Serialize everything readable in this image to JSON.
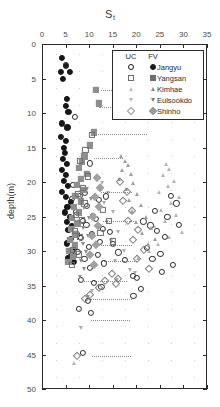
{
  "chart_data": {
    "type": "scatter",
    "title": "S",
    "title_subscript": "t",
    "xlabel": "",
    "ylabel": "depth(m)",
    "xlim": [
      0,
      35
    ],
    "ylim": [
      0,
      50
    ],
    "y_inverted": true,
    "xticks": [
      0,
      5,
      10,
      15,
      20,
      25,
      30,
      35
    ],
    "yticks": [
      0,
      5,
      10,
      15,
      20,
      25,
      30,
      35,
      40,
      45,
      50
    ],
    "grid": false,
    "legend": {
      "position": "top-right-inside",
      "columns": [
        "UC",
        "FV"
      ],
      "entries": [
        {
          "label": "Jangyu",
          "shape": "circle",
          "uc_fill": "open",
          "fv_fill": "filled",
          "color": "#1a1a1a"
        },
        {
          "label": "Yangsan",
          "shape": "square",
          "uc_fill": "open",
          "fv_fill": "filled",
          "color": "#6e6e6e"
        },
        {
          "label": "Kimhae",
          "shape": "triangle-up",
          "uc_fill": "open",
          "fv_fill": "filled",
          "color": "#8a8a8a"
        },
        {
          "label": "Eulsookdo",
          "shape": "triangle-down",
          "uc_fill": "open",
          "fv_fill": "filled",
          "color": "#7d7d7d"
        },
        {
          "label": "Shinho",
          "shape": "diamond",
          "uc_fill": "open",
          "fv_fill": "filled",
          "color": "#9a9a9a"
        }
      ]
    },
    "series": [
      {
        "name": "Jangyu FV",
        "shape": "circle",
        "fill": "filled",
        "color": "#161616",
        "points": [
          [
            4.3,
            2.0
          ],
          [
            5.0,
            3.2
          ],
          [
            4.0,
            4.0
          ],
          [
            5.9,
            4.0
          ],
          [
            4.5,
            5.0
          ],
          [
            5.3,
            7.9
          ],
          [
            5.0,
            9.0
          ],
          [
            5.6,
            9.8
          ],
          [
            4.2,
            11.5
          ],
          [
            5.4,
            12.1
          ],
          [
            4.0,
            13.5
          ],
          [
            5.0,
            14.1
          ],
          [
            4.6,
            15.0
          ],
          [
            4.8,
            15.8
          ],
          [
            4.4,
            16.6
          ],
          [
            5.2,
            17.4
          ],
          [
            4.2,
            18.2
          ],
          [
            5.0,
            19.0
          ],
          [
            4.6,
            19.8
          ],
          [
            5.5,
            20.6
          ],
          [
            4.2,
            21.4
          ],
          [
            5.0,
            22.2
          ],
          [
            6.2,
            22.9
          ],
          [
            5.4,
            23.6
          ],
          [
            4.8,
            24.4
          ],
          [
            6.0,
            25.1
          ],
          [
            5.2,
            25.8
          ],
          [
            6.4,
            26.4
          ],
          [
            5.6,
            27.0
          ],
          [
            7.3,
            27.6
          ],
          [
            6.1,
            28.2
          ],
          [
            5.2,
            28.9
          ],
          [
            7.0,
            29.6
          ],
          [
            6.2,
            30.3
          ],
          [
            5.6,
            31.0
          ],
          [
            6.8,
            31.6
          ]
        ]
      },
      {
        "name": "Jangyu UC",
        "shape": "circle",
        "fill": "open",
        "color": "#2b2b2b",
        "points": [
          [
            5.0,
            3.0
          ],
          [
            6.9,
            10.6
          ],
          [
            6.6,
            20.4
          ],
          [
            9.1,
            21.6
          ],
          [
            6.3,
            22.4
          ],
          [
            10.2,
            17.3
          ],
          [
            8.0,
            22.0
          ],
          [
            9.6,
            23.5
          ],
          [
            7.2,
            24.3
          ],
          [
            10.8,
            24.9
          ],
          [
            8.6,
            25.6
          ],
          [
            12.1,
            22.6
          ],
          [
            13.6,
            22.1
          ],
          [
            11.5,
            25.3
          ],
          [
            9.4,
            26.2
          ],
          [
            13.0,
            26.8
          ],
          [
            10.5,
            27.5
          ],
          [
            8.3,
            28.1
          ],
          [
            14.4,
            27.2
          ],
          [
            12.3,
            28.7
          ],
          [
            9.9,
            29.4
          ],
          [
            7.5,
            30.1
          ],
          [
            15.1,
            29.0
          ],
          [
            11.8,
            30.6
          ],
          [
            9.0,
            31.2
          ],
          [
            16.2,
            30.2
          ],
          [
            13.2,
            31.8
          ],
          [
            10.1,
            32.4
          ],
          [
            17.6,
            31.3
          ],
          [
            19.2,
            33.6
          ],
          [
            20.1,
            33.9
          ],
          [
            8.2,
            34.2
          ],
          [
            11.0,
            34.6
          ],
          [
            21.5,
            25.7
          ],
          [
            23.0,
            26.3
          ],
          [
            24.4,
            27.1
          ],
          [
            26.0,
            28.0
          ],
          [
            22.3,
            29.5
          ],
          [
            25.1,
            30.4
          ],
          [
            27.3,
            22.0
          ],
          [
            28.5,
            23.1
          ],
          [
            24.0,
            24.2
          ],
          [
            26.6,
            25.0
          ],
          [
            29.0,
            26.2
          ],
          [
            23.4,
            31.1
          ],
          [
            27.8,
            32.0
          ],
          [
            25.4,
            33.0
          ],
          [
            21.0,
            35.5
          ],
          [
            19.4,
            36.5
          ],
          [
            9.8,
            37.2
          ],
          [
            12.6,
            35.2
          ],
          [
            7.9,
            38.4
          ],
          [
            10.4,
            39.0
          ],
          [
            8.6,
            44.8
          ]
        ]
      },
      {
        "name": "Yangsan FV",
        "shape": "square",
        "fill": "filled",
        "color": "#8e8e8e",
        "points": [
          [
            11.4,
            6.6
          ],
          [
            12.0,
            8.6
          ],
          [
            11.0,
            12.8
          ],
          [
            10.2,
            14.7
          ],
          [
            9.0,
            16.3
          ],
          [
            8.4,
            17.1
          ],
          [
            7.8,
            18.0
          ],
          [
            9.6,
            18.8
          ],
          [
            8.2,
            19.6
          ],
          [
            7.4,
            20.4
          ],
          [
            8.9,
            21.2
          ],
          [
            7.1,
            22.0
          ],
          [
            8.3,
            22.8
          ],
          [
            6.8,
            23.6
          ],
          [
            7.9,
            24.4
          ],
          [
            6.4,
            25.2
          ],
          [
            7.5,
            26.0
          ],
          [
            6.2,
            26.8
          ],
          [
            7.1,
            27.6
          ],
          [
            6.0,
            28.4
          ],
          [
            6.9,
            29.2
          ],
          [
            5.8,
            30.0
          ],
          [
            6.6,
            30.8
          ],
          [
            5.6,
            31.6
          ]
        ]
      },
      {
        "name": "Yangsan UC",
        "shape": "square",
        "fill": "open",
        "color": "#6e6e6e",
        "points": [
          [
            10.6,
            13.2
          ],
          [
            9.2,
            15.4
          ],
          [
            8.0,
            16.9
          ],
          [
            9.8,
            19.2
          ],
          [
            8.6,
            20.9
          ],
          [
            7.6,
            21.7
          ],
          [
            9.0,
            23.1
          ],
          [
            7.2,
            24.8
          ],
          [
            8.4,
            25.5
          ],
          [
            6.9,
            27.1
          ],
          [
            8.0,
            28.0
          ],
          [
            6.6,
            29.8
          ],
          [
            7.8,
            30.5
          ],
          [
            6.3,
            32.0
          ],
          [
            13.0,
            24.0
          ],
          [
            14.2,
            25.6
          ],
          [
            12.4,
            27.4
          ],
          [
            15.0,
            28.6
          ]
        ]
      },
      {
        "name": "Kimhae FV",
        "shape": "triangle-up",
        "fill": "filled",
        "color": "#9e9e9e",
        "points": [
          [
            16.8,
            16.2
          ],
          [
            17.6,
            16.9
          ],
          [
            18.2,
            17.6
          ],
          [
            17.0,
            18.3
          ],
          [
            18.8,
            18.9
          ],
          [
            16.4,
            19.6
          ],
          [
            19.4,
            20.2
          ],
          [
            17.8,
            21.0
          ],
          [
            20.2,
            21.8
          ],
          [
            18.4,
            22.6
          ],
          [
            21.0,
            23.4
          ],
          [
            19.0,
            24.2
          ],
          [
            22.0,
            25.0
          ],
          [
            20.0,
            25.8
          ],
          [
            23.2,
            26.6
          ],
          [
            21.2,
            27.4
          ],
          [
            24.0,
            28.2
          ],
          [
            22.4,
            29.0
          ]
        ]
      },
      {
        "name": "Kimhae UC",
        "shape": "triangle-up",
        "fill": "open",
        "color": "#7a7a7a",
        "points": [
          [
            26.3,
            17.4
          ],
          [
            27.0,
            18.1
          ],
          [
            25.6,
            19.0
          ],
          [
            28.0,
            19.8
          ],
          [
            26.8,
            20.6
          ],
          [
            24.8,
            21.4
          ],
          [
            29.0,
            22.2
          ],
          [
            27.4,
            23.0
          ],
          [
            25.2,
            24.0
          ],
          [
            28.4,
            24.8
          ],
          [
            26.0,
            25.6
          ],
          [
            23.8,
            26.4
          ],
          [
            29.6,
            27.2
          ],
          [
            27.0,
            28.0
          ],
          [
            24.6,
            29.0
          ],
          [
            22.8,
            30.0
          ],
          [
            20.4,
            31.0
          ],
          [
            6.8,
            46.2
          ]
        ]
      },
      {
        "name": "Eulsookdo FV",
        "shape": "triangle-down",
        "fill": "filled",
        "color": "#8a8a8a",
        "points": [
          [
            9.6,
            21.0
          ],
          [
            10.4,
            22.4
          ],
          [
            9.0,
            23.8
          ],
          [
            10.0,
            25.2
          ],
          [
            8.8,
            26.6
          ],
          [
            9.8,
            27.8
          ],
          [
            8.6,
            29.0
          ],
          [
            9.4,
            30.2
          ],
          [
            8.2,
            31.4
          ],
          [
            9.0,
            32.6
          ],
          [
            8.0,
            33.8
          ]
        ]
      },
      {
        "name": "Eulsookdo UC",
        "shape": "triangle-down",
        "fill": "open",
        "color": "#6a6a6a",
        "points": [
          [
            12.8,
            20.2
          ],
          [
            14.0,
            21.6
          ],
          [
            13.2,
            23.0
          ],
          [
            15.0,
            24.4
          ],
          [
            13.8,
            25.8
          ],
          [
            16.2,
            27.2
          ],
          [
            14.6,
            28.6
          ],
          [
            17.4,
            30.0
          ],
          [
            15.4,
            31.4
          ],
          [
            18.6,
            32.8
          ],
          [
            16.0,
            34.2
          ],
          [
            19.8,
            33.2
          ],
          [
            10.6,
            35.8
          ],
          [
            9.8,
            36.6
          ],
          [
            8.2,
            41.2
          ]
        ]
      },
      {
        "name": "Shinho FV",
        "shape": "diamond",
        "fill": "filled",
        "color": "#a2a2a2",
        "points": [
          [
            11.6,
            19.4
          ],
          [
            12.4,
            20.8
          ],
          [
            11.2,
            22.2
          ],
          [
            12.0,
            23.6
          ],
          [
            10.8,
            25.0
          ],
          [
            11.8,
            26.4
          ],
          [
            10.6,
            27.8
          ],
          [
            11.4,
            29.2
          ],
          [
            10.2,
            30.6
          ],
          [
            11.0,
            32.0
          ]
        ]
      },
      {
        "name": "Shinho UC",
        "shape": "diamond",
        "fill": "open",
        "color": "#7e7e7e",
        "points": [
          [
            16.6,
            20.0
          ],
          [
            18.0,
            21.4
          ],
          [
            17.2,
            22.8
          ],
          [
            19.0,
            24.2
          ],
          [
            18.2,
            25.6
          ],
          [
            20.4,
            27.0
          ],
          [
            19.2,
            28.4
          ],
          [
            21.6,
            29.8
          ],
          [
            20.2,
            31.2
          ],
          [
            22.8,
            32.6
          ],
          [
            14.8,
            33.4
          ],
          [
            16.2,
            34.0
          ],
          [
            13.4,
            34.4
          ],
          [
            15.6,
            34.8
          ],
          [
            12.0,
            35.4
          ],
          [
            10.2,
            36.4
          ],
          [
            9.2,
            37.0
          ],
          [
            7.4,
            45.2
          ]
        ]
      }
    ],
    "trend_lines": [
      {
        "y": 6.6,
        "x0": 12.6,
        "x1": 20.0
      },
      {
        "y": 9.2,
        "x0": 12.0,
        "x1": 21.0
      },
      {
        "y": 13.0,
        "x0": 11.8,
        "x1": 22.2
      },
      {
        "y": 16.5,
        "x0": 11.0,
        "x1": 17.2
      },
      {
        "y": 21.5,
        "x0": 12.6,
        "x1": 19.0
      },
      {
        "y": 25.6,
        "x0": 13.0,
        "x1": 20.0
      },
      {
        "y": 29.2,
        "x0": 12.0,
        "x1": 19.0
      },
      {
        "y": 31.5,
        "x0": 12.6,
        "x1": 20.2
      },
      {
        "y": 34.3,
        "x0": 9.0,
        "x1": 18.0
      },
      {
        "y": 37.0,
        "x0": 10.2,
        "x1": 19.0
      },
      {
        "y": 40.0,
        "x0": 10.4,
        "x1": 18.6
      },
      {
        "y": 45.2,
        "x0": 10.6,
        "x1": 18.8
      }
    ]
  }
}
